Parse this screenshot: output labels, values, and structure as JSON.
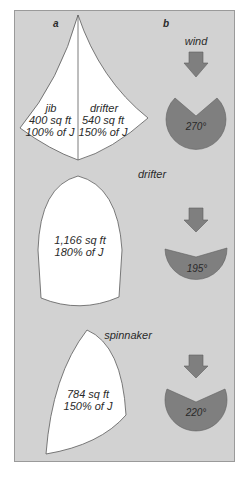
{
  "panel_labels": {
    "a": "a",
    "b": "b"
  },
  "wind_label": "wind",
  "sails": [
    {
      "name": "jib",
      "area": "400 sq ft",
      "percent": "100% of J"
    },
    {
      "name": "drifter",
      "area": "540 sq ft",
      "percent": "150% of J"
    },
    {
      "name": "drifter",
      "area": "1,166 sq ft",
      "percent": "180% of J"
    },
    {
      "name": "spinnaker",
      "area": "784 sq ft",
      "percent": "150% of J"
    }
  ],
  "sectors": [
    {
      "angle": "270°"
    },
    {
      "angle": "195°"
    },
    {
      "angle": "220°"
    }
  ],
  "colors": {
    "background": "#d2d2d2",
    "sail": "#ffffff",
    "sector": "#7f7f7f",
    "arrow": "#7f7f7f",
    "outline": "#5a5a5a"
  }
}
